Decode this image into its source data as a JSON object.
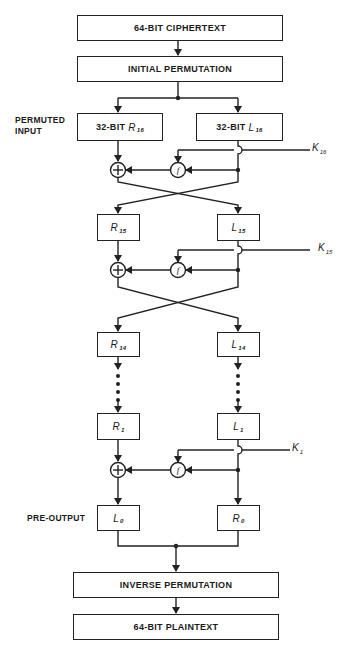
{
  "diagram": {
    "top_boxes": {
      "input": "64-BIT CIPHERTEXT",
      "initial_permutation": "INITIAL PERMUTATION"
    },
    "side_labels": {
      "permuted_input": "PERMUTED INPUT",
      "pre_output": "PRE-OUTPUT"
    },
    "stages": [
      {
        "left": {
          "prefix": "32-BIT",
          "var": "R",
          "sub": "16"
        },
        "right": {
          "prefix": "32-BIT",
          "var": "L",
          "sub": "16"
        },
        "key": {
          "var": "K",
          "sub": "16"
        }
      },
      {
        "left": {
          "prefix": "",
          "var": "R",
          "sub": "15"
        },
        "right": {
          "prefix": "",
          "var": "L",
          "sub": "15"
        },
        "key": {
          "var": "K",
          "sub": "15"
        }
      },
      {
        "left": {
          "prefix": "",
          "var": "R",
          "sub": "14"
        },
        "right": {
          "prefix": "",
          "var": "L",
          "sub": "14"
        }
      },
      {
        "left": {
          "prefix": "",
          "var": "R",
          "sub": "1"
        },
        "right": {
          "prefix": "",
          "var": "L",
          "sub": "1"
        },
        "key": {
          "var": "K",
          "sub": "1"
        }
      },
      {
        "left": {
          "prefix": "",
          "var": "L",
          "sub": "0"
        },
        "right": {
          "prefix": "",
          "var": "R",
          "sub": "0"
        }
      }
    ],
    "function_symbol": "f",
    "xor_symbol": "+",
    "bottom_boxes": {
      "inverse_permutation": "INVERSE PERMUTATION",
      "output": "64-BIT PLAINTEXT"
    },
    "colors": {
      "line": "#222222",
      "background": "#ffffff"
    }
  }
}
